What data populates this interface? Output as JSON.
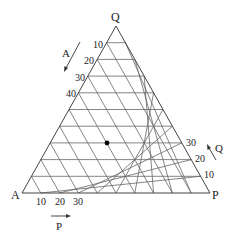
{
  "diagram": {
    "type": "ternary",
    "vertices": {
      "top": "Q",
      "left": "A",
      "right": "P"
    },
    "divisions": 10,
    "axis_labels": {
      "A": {
        "label": "A",
        "ticks": [
          "10",
          "20",
          "30",
          "40"
        ],
        "direction": "down-left along left edge"
      },
      "P": {
        "label": "P",
        "ticks": [
          "10",
          "20",
          "30"
        ],
        "direction": "right along bottom edge"
      },
      "Q": {
        "label": "Q",
        "ticks": [
          "10",
          "20",
          "30"
        ],
        "direction": "up-left along right edge"
      }
    },
    "marked_point": {
      "A": 40,
      "P": 30,
      "Q": 30
    },
    "colors": {
      "line": "#555555",
      "text": "#222222",
      "point": "#000000"
    }
  }
}
